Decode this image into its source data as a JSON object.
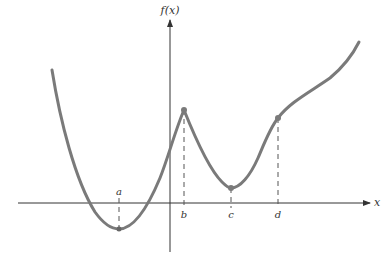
{
  "diagram": {
    "type": "function-graph",
    "y_axis_label": "f(x)",
    "x_axis_label": "x",
    "points": [
      {
        "label": "a",
        "x": 119,
        "y": 229,
        "label_pos": "above-axis",
        "kind": "local-minimum"
      },
      {
        "label": "b",
        "x": 184,
        "y": 110,
        "label_pos": "below-axis",
        "kind": "cusp-maximum"
      },
      {
        "label": "c",
        "x": 231,
        "y": 188,
        "label_pos": "below-axis",
        "kind": "local-minimum"
      },
      {
        "label": "d",
        "x": 278,
        "y": 118,
        "label_pos": "below-axis",
        "kind": "point"
      }
    ],
    "colors": {
      "curve": "#7a7a7a",
      "axes": "#333333",
      "dashes": "#555555",
      "background": "#ffffff"
    }
  }
}
